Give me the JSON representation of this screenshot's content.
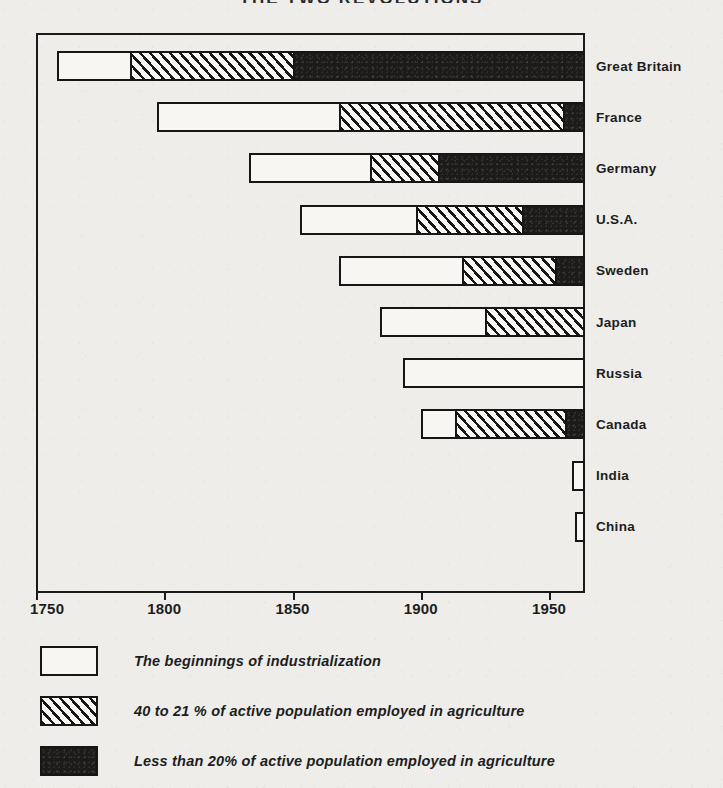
{
  "chart_title": "THE TWO REVOLUTIONS",
  "chart_data": {
    "type": "bar",
    "orientation": "horizontal",
    "subtype": "stacked-timeline",
    "title": "THE TWO REVOLUTIONS",
    "xlabel": "",
    "ylabel": "",
    "xlim": [
      1750,
      1964
    ],
    "grid": false,
    "legend_position": "below",
    "axis_ticks": [
      1750,
      1800,
      1850,
      1900,
      1950
    ],
    "tick_labels": [
      "1750",
      "1800",
      "1850",
      "1900",
      "1950"
    ],
    "categories": [
      "Great Britain",
      "France",
      "Germany",
      "U.S.A.",
      "Sweden",
      "Japan",
      "Russia",
      "Canada",
      "India",
      "China"
    ],
    "series": [
      {
        "name": "The beginnings of industrialization",
        "fill": "white",
        "spans": [
          [
            1758,
            1786
          ],
          [
            1797,
            1868
          ],
          [
            1833,
            1880
          ],
          [
            1853,
            1898
          ],
          [
            1868,
            1916
          ],
          [
            1884,
            1925
          ],
          [
            1893,
            1964
          ],
          [
            1900,
            1913
          ],
          [
            1959,
            1964
          ],
          [
            1960,
            1964
          ]
        ]
      },
      {
        "name": "40 to 21 % of active population employed in agriculture",
        "fill": "hatch",
        "spans": [
          [
            1786,
            1850
          ],
          [
            1868,
            1956
          ],
          [
            1880,
            1907
          ],
          [
            1898,
            1940
          ],
          [
            1916,
            1953
          ],
          [
            1925,
            1964
          ],
          null,
          [
            1913,
            1957
          ],
          null,
          null
        ]
      },
      {
        "name": "Less than 20% of active population employed in agriculture",
        "fill": "black",
        "spans": [
          [
            1850,
            1964
          ],
          [
            1956,
            1964
          ],
          [
            1907,
            1964
          ],
          [
            1940,
            1964
          ],
          [
            1953,
            1964
          ],
          null,
          null,
          [
            1957,
            1964
          ],
          null,
          null
        ]
      }
    ],
    "bars": [
      {
        "label": "Great Britain",
        "start": 1758,
        "white_end": 1786,
        "hatch_end": 1850,
        "black_end": 1964
      },
      {
        "label": "France",
        "start": 1797,
        "white_end": 1868,
        "hatch_end": 1956,
        "black_end": 1964
      },
      {
        "label": "Germany",
        "start": 1833,
        "white_end": 1880,
        "hatch_end": 1907,
        "black_end": 1964
      },
      {
        "label": "U.S.A.",
        "start": 1853,
        "white_end": 1898,
        "hatch_end": 1940,
        "black_end": 1964
      },
      {
        "label": "Sweden",
        "start": 1868,
        "white_end": 1916,
        "hatch_end": 1953,
        "black_end": 1964
      },
      {
        "label": "Japan",
        "start": 1884,
        "white_end": 1925,
        "hatch_end": 1964,
        "black_end": 1964
      },
      {
        "label": "Russia",
        "start": 1893,
        "white_end": 1964,
        "hatch_end": 1964,
        "black_end": 1964
      },
      {
        "label": "Canada",
        "start": 1900,
        "white_end": 1913,
        "hatch_end": 1957,
        "black_end": 1964
      },
      {
        "label": "India",
        "start": 1959,
        "white_end": 1964,
        "hatch_end": 1964,
        "black_end": 1964
      },
      {
        "label": "China",
        "start": 1960,
        "white_end": 1964,
        "hatch_end": 1964,
        "black_end": 1964
      }
    ],
    "legend": [
      {
        "key": "white",
        "label": "The beginnings of industrialization"
      },
      {
        "key": "hatch",
        "label": "40 to 21 % of active population employed in agriculture"
      },
      {
        "key": "black",
        "label": "Less than 20% of active population employed in agriculture"
      }
    ]
  },
  "colors": {
    "ink": "#161616",
    "paper": "#eeedea",
    "fill_white": "#f7f6f3",
    "fill_black": "#1c1b19"
  }
}
